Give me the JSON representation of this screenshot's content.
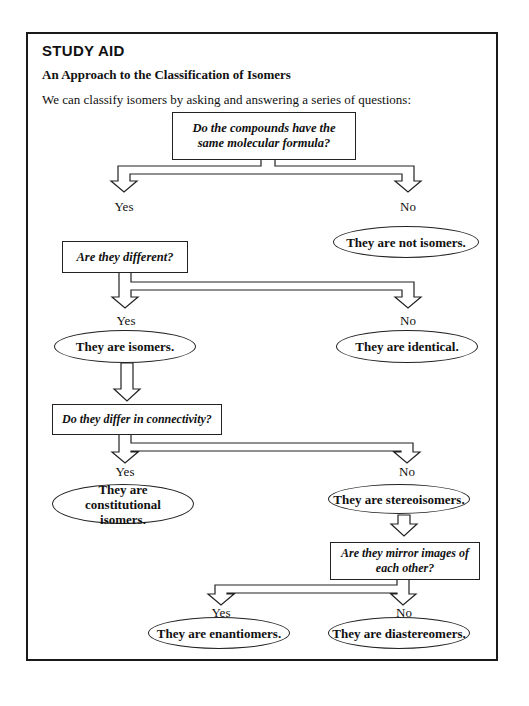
{
  "header": {
    "badge": "STUDY AID",
    "title": "An Approach to the Classification of Isomers",
    "intro": "We can classify isomers by asking and answering a series of questions:"
  },
  "flowchart": {
    "q1": {
      "text": "Do the compounds have the same molecular formula?",
      "yes": "Yes",
      "no": "No"
    },
    "q1_no_result": "They are not isomers.",
    "q2": {
      "text": "Are they different?",
      "yes": "Yes",
      "no": "No"
    },
    "q2_yes_result": "They are isomers.",
    "q2_no_result": "They are identical.",
    "q3": {
      "text": "Do they differ in connectivity?",
      "yes": "Yes",
      "no": "No"
    },
    "q3_yes_result": "They are constitutional isomers.",
    "q3_no_result": "They are stereoisomers.",
    "q4": {
      "text": "Are they mirror images of each other?",
      "yes": "Yes",
      "no": "No"
    },
    "q4_yes_result": "They are enantiomers.",
    "q4_no_result": "They are diastereomers."
  },
  "colors": {
    "ink": "#1a1a1a",
    "background": "#ffffff"
  }
}
